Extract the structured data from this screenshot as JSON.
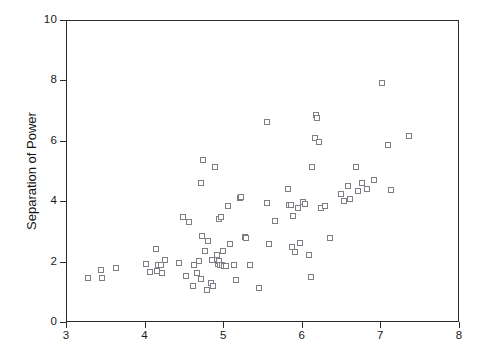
{
  "chart_data": {
    "type": "scatter",
    "title": "",
    "subtitle": "",
    "xlabel": "",
    "ylabel": "Separation of Power",
    "xlim": [
      3,
      8
    ],
    "ylim": [
      0,
      10
    ],
    "xticks": [
      3,
      4,
      5,
      6,
      7,
      8
    ],
    "yticks": [
      0,
      2,
      4,
      6,
      8,
      10
    ],
    "grid": false,
    "legend": null,
    "marker": {
      "shape": "open-square",
      "size_px": 5,
      "edge_color": "#7d7d85",
      "fill_color": "#ffffff"
    },
    "frame_color": "#2b2b2b",
    "background_color": "#ffffff",
    "n_points": 106,
    "annotations": [],
    "points": [
      [
        3.27,
        1.5
      ],
      [
        3.43,
        1.77
      ],
      [
        3.44,
        1.5
      ],
      [
        3.62,
        1.82
      ],
      [
        4.0,
        1.95
      ],
      [
        4.05,
        1.68
      ],
      [
        4.13,
        2.45
      ],
      [
        4.14,
        1.73
      ],
      [
        4.16,
        1.93
      ],
      [
        4.2,
        1.93
      ],
      [
        4.21,
        1.65
      ],
      [
        4.25,
        2.1
      ],
      [
        4.43,
        1.98
      ],
      [
        4.48,
        3.5
      ],
      [
        4.51,
        1.55
      ],
      [
        4.55,
        3.35
      ],
      [
        4.6,
        1.22
      ],
      [
        4.62,
        1.93
      ],
      [
        4.65,
        1.65
      ],
      [
        4.68,
        2.05
      ],
      [
        4.7,
        1.46
      ],
      [
        4.71,
        4.65
      ],
      [
        4.72,
        2.88
      ],
      [
        4.73,
        5.4
      ],
      [
        4.75,
        2.4
      ],
      [
        4.78,
        1.1
      ],
      [
        4.8,
        2.72
      ],
      [
        4.83,
        1.33
      ],
      [
        4.84,
        2.1
      ],
      [
        4.86,
        1.22
      ],
      [
        4.88,
        5.15
      ],
      [
        4.91,
        2.25
      ],
      [
        4.92,
        1.95
      ],
      [
        4.93,
        2.05
      ],
      [
        4.94,
        3.43
      ],
      [
        4.95,
        1.93
      ],
      [
        4.96,
        3.5
      ],
      [
        4.97,
        1.92
      ],
      [
        4.99,
        2.4
      ],
      [
        5.0,
        1.9
      ],
      [
        5.02,
        1.88
      ],
      [
        5.05,
        3.88
      ],
      [
        5.08,
        2.62
      ],
      [
        5.12,
        1.92
      ],
      [
        5.15,
        1.43
      ],
      [
        5.2,
        4.15
      ],
      [
        5.22,
        4.18
      ],
      [
        5.26,
        2.85
      ],
      [
        5.28,
        2.8
      ],
      [
        5.33,
        1.92
      ],
      [
        5.44,
        1.15
      ],
      [
        5.54,
        6.65
      ],
      [
        5.55,
        3.98
      ],
      [
        5.57,
        2.62
      ],
      [
        5.65,
        3.38
      ],
      [
        5.81,
        4.45
      ],
      [
        5.83,
        3.9
      ],
      [
        5.85,
        3.9
      ],
      [
        5.86,
        2.52
      ],
      [
        5.88,
        3.55
      ],
      [
        5.9,
        2.35
      ],
      [
        5.94,
        3.82
      ],
      [
        5.96,
        2.65
      ],
      [
        6.0,
        4.0
      ],
      [
        6.03,
        3.95
      ],
      [
        6.08,
        2.25
      ],
      [
        6.1,
        1.52
      ],
      [
        6.12,
        5.15
      ],
      [
        6.15,
        6.12
      ],
      [
        6.17,
        6.9
      ],
      [
        6.18,
        6.78
      ],
      [
        6.2,
        5.98
      ],
      [
        6.23,
        3.82
      ],
      [
        6.28,
        3.88
      ],
      [
        6.35,
        2.82
      ],
      [
        6.48,
        4.28
      ],
      [
        6.52,
        4.05
      ],
      [
        6.57,
        4.55
      ],
      [
        6.6,
        4.1
      ],
      [
        6.68,
        5.15
      ],
      [
        6.7,
        4.38
      ],
      [
        6.75,
        4.62
      ],
      [
        6.82,
        4.45
      ],
      [
        6.9,
        4.72
      ],
      [
        7.01,
        7.95
      ],
      [
        7.08,
        5.9
      ],
      [
        7.12,
        4.4
      ],
      [
        7.35,
        6.2
      ]
    ]
  },
  "axes": {
    "y_tick_labels": [
      "10",
      "8",
      "6",
      "4",
      "2",
      "0"
    ],
    "x_tick_labels": [
      "3",
      "4",
      "5",
      "6",
      "7",
      "8"
    ],
    "y_title": "Separation of Power",
    "x_title": ""
  }
}
